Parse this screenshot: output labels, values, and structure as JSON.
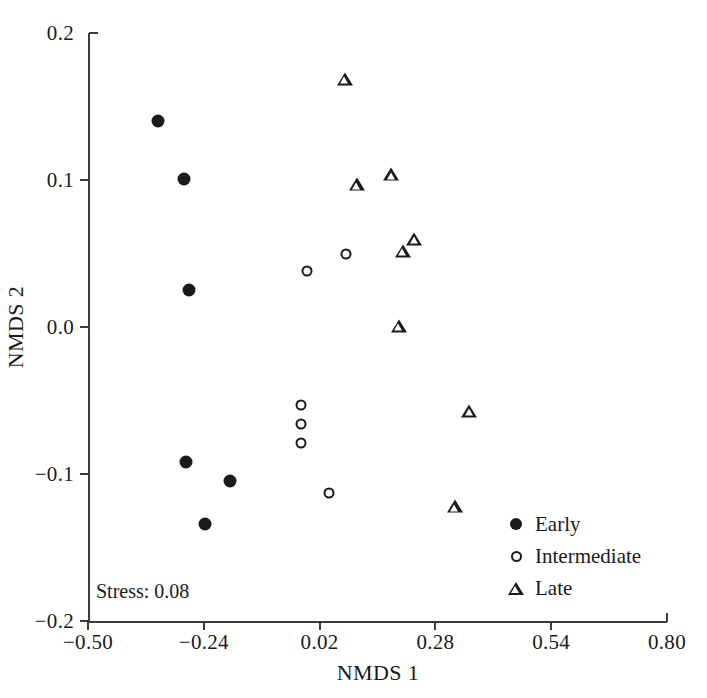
{
  "chart_data": {
    "type": "scatter",
    "title": "",
    "xlabel": "NMDS 1",
    "ylabel": "NMDS 2",
    "xlim": [
      -0.5,
      0.8
    ],
    "ylim": [
      -0.2,
      0.2
    ],
    "xticks": [
      -0.5,
      -0.24,
      0.02,
      0.28,
      0.54,
      0.8
    ],
    "xticklabels": [
      "−0.50",
      "−0.24",
      "0.02",
      "0.28",
      "0.54",
      "0.80"
    ],
    "yticks": [
      0.2,
      0.1,
      0.0,
      -0.1,
      -0.2
    ],
    "yticklabels": [
      "0.2",
      "0.1",
      "0.0",
      "−0.1",
      "−0.2"
    ],
    "grid": false,
    "legend_position": "lower-right",
    "annotations": [
      {
        "name": "stress",
        "text": "Stress: 0.08",
        "x": -0.48,
        "y": -0.185
      }
    ],
    "series": [
      {
        "name": "Early",
        "marker": "filled-circle",
        "color": "#1a1a1a",
        "points": [
          {
            "x": -0.342,
            "y": 0.14
          },
          {
            "x": -0.285,
            "y": 0.101
          },
          {
            "x": -0.274,
            "y": 0.025
          },
          {
            "x": -0.281,
            "y": -0.092
          },
          {
            "x": -0.181,
            "y": -0.105
          },
          {
            "x": -0.238,
            "y": -0.134
          }
        ]
      },
      {
        "name": "Intermediate",
        "marker": "open-circle",
        "color": "#1a1a1a",
        "points": [
          {
            "x": -0.009,
            "y": 0.038
          },
          {
            "x": 0.079,
            "y": 0.05
          },
          {
            "x": -0.022,
            "y": -0.053
          },
          {
            "x": -0.022,
            "y": -0.066
          },
          {
            "x": -0.022,
            "y": -0.079
          },
          {
            "x": 0.042,
            "y": -0.113
          }
        ]
      },
      {
        "name": "Late",
        "marker": "open-triangle",
        "color": "#1a1a1a",
        "points": [
          {
            "x": 0.077,
            "y": 0.169
          },
          {
            "x": 0.103,
            "y": 0.097
          },
          {
            "x": 0.181,
            "y": 0.104
          },
          {
            "x": 0.207,
            "y": 0.052
          },
          {
            "x": 0.233,
            "y": 0.06
          },
          {
            "x": 0.198,
            "y": 0.001
          },
          {
            "x": 0.356,
            "y": -0.057
          },
          {
            "x": 0.324,
            "y": -0.122
          }
        ]
      }
    ]
  },
  "legend": {
    "items": [
      {
        "label": "Early",
        "marker": "filled-circle"
      },
      {
        "label": "Intermediate",
        "marker": "open-circle"
      },
      {
        "label": "Late",
        "marker": "open-triangle"
      }
    ]
  }
}
